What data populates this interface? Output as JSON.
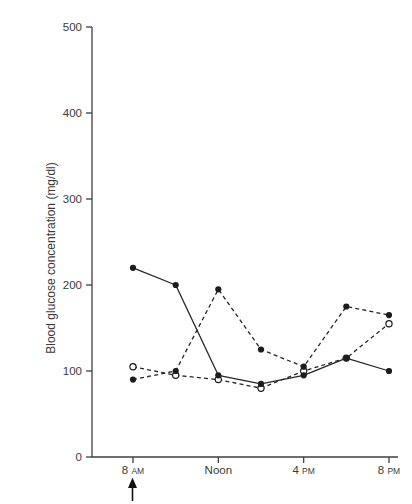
{
  "figure": {
    "background_color": "#ffffff",
    "ink_color": "#3a3a3a",
    "series_color": "#1c1c1c"
  },
  "chart_data": {
    "type": "line",
    "title": "",
    "xlabel": "",
    "ylabel": "Blood glucose concentration (mg/dl)",
    "ylim": [
      0,
      500
    ],
    "y_ticks": [
      0,
      100,
      200,
      300,
      400,
      500
    ],
    "grid": false,
    "legend": "none",
    "x_categories": [
      "8 AM",
      "10 AM",
      "Noon",
      "2 PM",
      "4 PM",
      "6 PM",
      "8 PM"
    ],
    "x_ticks": [
      {
        "at": 0,
        "main": "8",
        "small": "AM"
      },
      {
        "at": 2,
        "main": "Noon",
        "small": ""
      },
      {
        "at": 4,
        "main": "4",
        "small": "PM"
      },
      {
        "at": 6,
        "main": "8",
        "small": "PM"
      }
    ],
    "annotations": [
      {
        "type": "up-arrow",
        "at_category": "8 AM",
        "position": "below-axis"
      }
    ],
    "series": [
      {
        "name": "solid-filled-circles",
        "line": "solid",
        "marker": "filled-circle",
        "values": [
          220,
          200,
          95,
          85,
          95,
          115,
          100
        ]
      },
      {
        "name": "dashed-filled-circles",
        "line": "dashed",
        "marker": "filled-circle",
        "values": [
          90,
          100,
          195,
          125,
          105,
          175,
          165
        ]
      },
      {
        "name": "dashed-open-circles",
        "line": "dashed",
        "marker": "open-circle",
        "values": [
          105,
          95,
          90,
          80,
          100,
          115,
          155
        ]
      }
    ]
  }
}
